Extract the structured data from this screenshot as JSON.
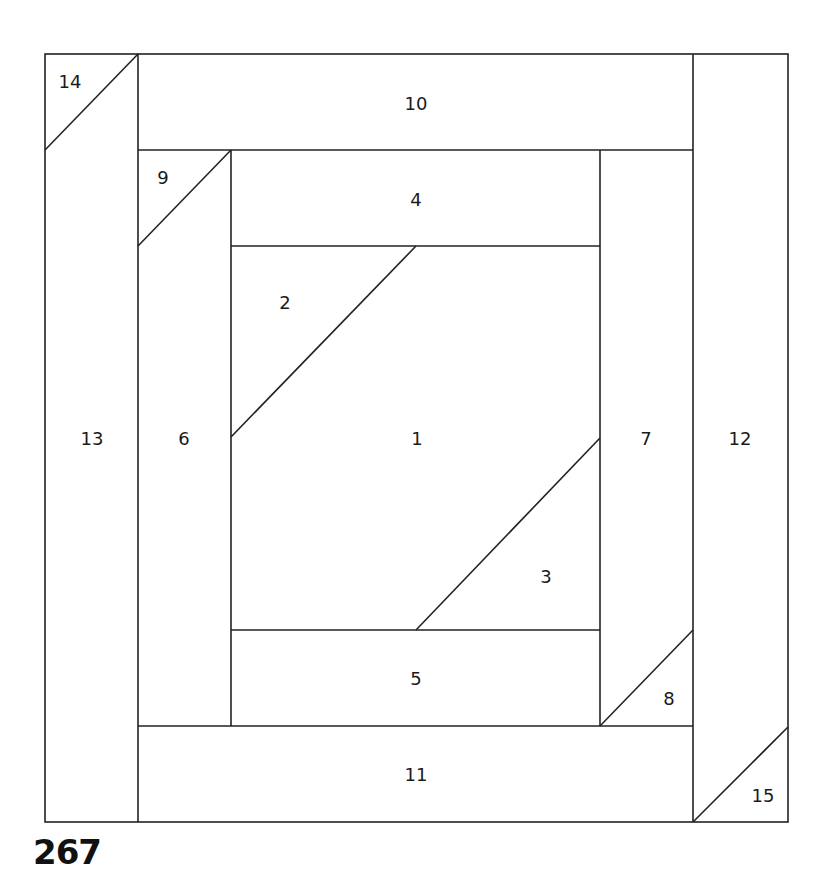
{
  "pattern_number": "267",
  "pieces": [
    {
      "id": "1",
      "x": 417,
      "y": 438
    },
    {
      "id": "2",
      "x": 285,
      "y": 302
    },
    {
      "id": "3",
      "x": 546,
      "y": 576
    },
    {
      "id": "4",
      "x": 416,
      "y": 199
    },
    {
      "id": "5",
      "x": 416,
      "y": 678
    },
    {
      "id": "6",
      "x": 184,
      "y": 438
    },
    {
      "id": "7",
      "x": 646,
      "y": 438
    },
    {
      "id": "8",
      "x": 669,
      "y": 698
    },
    {
      "id": "9",
      "x": 163,
      "y": 177
    },
    {
      "id": "10",
      "x": 416,
      "y": 103
    },
    {
      "id": "11",
      "x": 416,
      "y": 774
    },
    {
      "id": "12",
      "x": 740,
      "y": 438
    },
    {
      "id": "13",
      "x": 92,
      "y": 438
    },
    {
      "id": "14",
      "x": 70,
      "y": 81
    },
    {
      "id": "15",
      "x": 763,
      "y": 795
    }
  ]
}
